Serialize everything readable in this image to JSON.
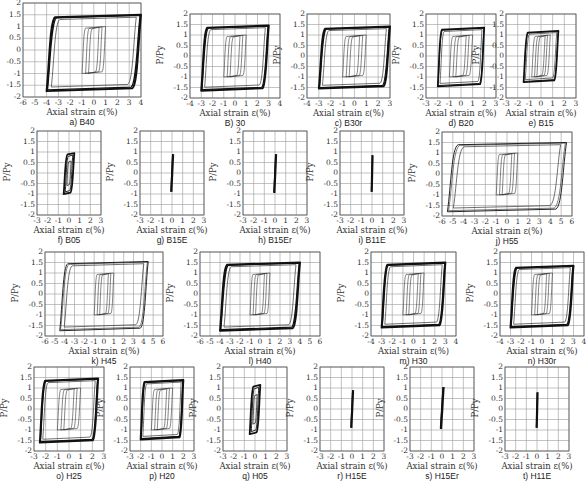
{
  "chart_data": {
    "type": "line",
    "title": "",
    "figure_description": "Grid of 20 axial load ratio vs axial strain hysteresis plots",
    "common": {
      "ylabel": "P/Py",
      "xlabel": "Axial strain ε(%)",
      "yticks": [
        -2,
        -1.5,
        -1,
        -0.5,
        0,
        0.5,
        1,
        1.5,
        2
      ],
      "ytick_labels": [
        "-2",
        "-1.5",
        "-1",
        "-0.5",
        "0",
        "0.5",
        "1",
        "1.5",
        "2"
      ],
      "ylim": [
        -2,
        2
      ],
      "grid": true
    },
    "panels": [
      {
        "id": "a",
        "caption": "a) B40",
        "xlim": [
          -6,
          4
        ],
        "xticks": [
          -6,
          -5,
          -4,
          -3,
          -2,
          -1,
          0,
          1,
          2,
          3,
          4
        ],
        "xtick_labels": [
          "-6",
          "-5",
          "-4",
          "-3",
          "-2",
          "-1",
          "0",
          "1",
          "2",
          "3",
          "4"
        ],
        "box": [
          23,
          3,
          118,
          94
        ],
        "outer_strain": 4,
        "inner_strain": 1,
        "outer_tension": 1.5,
        "outer_compression": -1.75,
        "style": "large"
      },
      {
        "id": "b",
        "caption": "B) 30",
        "xlim": [
          -4,
          4
        ],
        "xticks": [
          -4,
          -3,
          -2,
          -1,
          0,
          1,
          2,
          3,
          4
        ],
        "xtick_labels": [
          "-4",
          "-3",
          "-2",
          "-1",
          "0",
          "1",
          "2",
          "3",
          "4"
        ],
        "box": [
          190,
          14,
          90,
          84
        ],
        "outer_strain": 3,
        "inner_strain": 1,
        "outer_tension": 1.45,
        "outer_compression": -1.65,
        "style": "large"
      },
      {
        "id": "c",
        "caption": "c) B30r",
        "xlim": [
          -4,
          3
        ],
        "xticks": [
          -4,
          -3,
          -2,
          -1,
          0,
          1,
          2,
          3
        ],
        "xtick_labels": [
          "-4",
          "-3",
          "-2",
          "-1",
          "0",
          "1",
          "2",
          "3"
        ],
        "box": [
          307,
          14,
          83,
          84
        ],
        "outer_strain": 3,
        "inner_strain": 1,
        "outer_tension": 1.4,
        "outer_compression": -1.55,
        "style": "large"
      },
      {
        "id": "d",
        "caption": "d) B20",
        "xlim": [
          -3,
          3
        ],
        "xticks": [
          -3,
          -2,
          -1,
          0,
          1,
          2,
          3
        ],
        "xtick_labels": [
          "-3",
          "-2",
          "-1",
          "0",
          "1",
          "2",
          "3"
        ],
        "box": [
          426,
          14,
          70,
          84
        ],
        "outer_strain": 2,
        "inner_strain": 1,
        "outer_tension": 1.35,
        "outer_compression": -1.45,
        "style": "medium"
      },
      {
        "id": "e",
        "caption": "e) B15",
        "xlim": [
          -3,
          3
        ],
        "xticks": [
          -3,
          -2,
          -1,
          0,
          1,
          2,
          3
        ],
        "xtick_labels": [
          "-3",
          "-2",
          "-1",
          "0",
          "1",
          "2",
          "3"
        ],
        "box": [
          506,
          14,
          70,
          84
        ],
        "outer_strain": 1.5,
        "inner_strain": 0.8,
        "outer_tension": 1.2,
        "outer_compression": -1.25,
        "style": "medium"
      },
      {
        "id": "f",
        "caption": "f) B05",
        "xlim": [
          -3,
          3
        ],
        "xticks": [
          -3,
          -2,
          -1,
          0,
          1,
          2,
          3
        ],
        "xtick_labels": [
          "-3",
          "-2",
          "-1",
          "0",
          "1",
          "2",
          "3"
        ],
        "box": [
          37,
          131,
          64,
          84
        ],
        "outer_strain": 0.5,
        "inner_strain": 0.3,
        "outer_tension": 0.95,
        "outer_compression": -1.0,
        "style": "small"
      },
      {
        "id": "g",
        "caption": "g) B15E",
        "xlim": [
          -3,
          3
        ],
        "xticks": [
          -3,
          -2,
          -1,
          0,
          1,
          2,
          3
        ],
        "xtick_labels": [
          "-3",
          "-2",
          "-1",
          "0",
          "1",
          "2",
          "3"
        ],
        "box": [
          140,
          131,
          64,
          84
        ],
        "outer_strain": 0.1,
        "inner_strain": 0,
        "outer_tension": 0.9,
        "outer_compression": -0.9,
        "style": "elastic"
      },
      {
        "id": "h",
        "caption": "h) B15Er",
        "xlim": [
          -3,
          3
        ],
        "xticks": [
          -3,
          -2,
          -1,
          0,
          1,
          2,
          3
        ],
        "xtick_labels": [
          "-3",
          "-2",
          "-1",
          "0",
          "1",
          "2",
          "3"
        ],
        "box": [
          243,
          131,
          64,
          84
        ],
        "outer_strain": 0.1,
        "inner_strain": 0,
        "outer_tension": 0.9,
        "outer_compression": -0.95,
        "style": "elastic"
      },
      {
        "id": "i",
        "caption": "i) B11E",
        "xlim": [
          -3,
          3
        ],
        "xticks": [
          -3,
          -2,
          -1,
          0,
          1,
          2,
          3
        ],
        "xtick_labels": [
          "-3",
          "-2",
          "-1",
          "0",
          "1",
          "2",
          "3"
        ],
        "box": [
          340,
          131,
          64,
          84
        ],
        "outer_strain": 0.05,
        "inner_strain": 0,
        "outer_tension": 0.85,
        "outer_compression": -0.9,
        "style": "elastic"
      },
      {
        "id": "j",
        "caption": "j) H55",
        "xlim": [
          -6,
          6
        ],
        "xticks": [
          -6,
          -5,
          -4,
          -3,
          -2,
          -1,
          0,
          1,
          2,
          3,
          4,
          5,
          6
        ],
        "xtick_labels": [
          "-6",
          "-5",
          "-4",
          "-3",
          "-2",
          "-1",
          "0",
          "1",
          "2",
          "3",
          "4",
          "5",
          "6"
        ],
        "box": [
          442,
          132,
          130,
          84
        ],
        "outer_strain": 5.5,
        "inner_strain": 1,
        "outer_tension": 1.5,
        "outer_compression": -1.8,
        "style": "thin"
      },
      {
        "id": "k",
        "caption": "k) H45",
        "xlim": [
          -6,
          6
        ],
        "xticks": [
          -6,
          -5,
          -4,
          -3,
          -2,
          -1,
          0,
          1,
          2,
          3,
          4,
          5,
          6
        ],
        "xtick_labels": [
          "-6",
          "-5",
          "-4",
          "-3",
          "-2",
          "-1",
          "0",
          "1",
          "2",
          "3",
          "4",
          "5",
          "6"
        ],
        "box": [
          45,
          252,
          118,
          84
        ],
        "outer_strain": 4.5,
        "inner_strain": 1,
        "outer_tension": 1.55,
        "outer_compression": -1.75,
        "style": "thin"
      },
      {
        "id": "l",
        "caption": "l) H40",
        "xlim": [
          -6,
          6
        ],
        "xticks": [
          -6,
          -5,
          -4,
          -3,
          -2,
          -1,
          0,
          1,
          2,
          3,
          4,
          5,
          6
        ],
        "xtick_labels": [
          "-6",
          "-5",
          "-4",
          "-3",
          "-2",
          "-1",
          "0",
          "1",
          "2",
          "3",
          "4",
          "5",
          "6"
        ],
        "box": [
          200,
          252,
          120,
          84
        ],
        "outer_strain": 4,
        "inner_strain": 1,
        "outer_tension": 1.5,
        "outer_compression": -1.75,
        "style": "large"
      },
      {
        "id": "m",
        "caption": "m) H30",
        "xlim": [
          -4,
          4
        ],
        "xticks": [
          -4,
          -3,
          -2,
          -1,
          0,
          1,
          2,
          3,
          4
        ],
        "xtick_labels": [
          "-4",
          "-3",
          "-2",
          "-1",
          "0",
          "1",
          "2",
          "3",
          "4"
        ],
        "box": [
          371,
          252,
          85,
          84
        ],
        "outer_strain": 3,
        "inner_strain": 1,
        "outer_tension": 1.5,
        "outer_compression": -1.6,
        "style": "large"
      },
      {
        "id": "n",
        "caption": "n) H30r",
        "xlim": [
          -4,
          4
        ],
        "xticks": [
          -4,
          -3,
          -2,
          -1,
          0,
          1,
          2,
          3,
          4
        ],
        "xtick_labels": [
          "-4",
          "-3",
          "-2",
          "-1",
          "0",
          "1",
          "2",
          "3",
          "4"
        ],
        "box": [
          500,
          252,
          84,
          84
        ],
        "outer_strain": 3,
        "inner_strain": 1,
        "outer_tension": 1.35,
        "outer_compression": -1.6,
        "style": "large"
      },
      {
        "id": "o",
        "caption": "o) H25",
        "xlim": [
          -3,
          3
        ],
        "xticks": [
          -3,
          -2,
          -1,
          0,
          1,
          2,
          3
        ],
        "xtick_labels": [
          "-3",
          "-2",
          "-1",
          "0",
          "1",
          "2",
          "3"
        ],
        "box": [
          34,
          367,
          70,
          84
        ],
        "outer_strain": 2.5,
        "inner_strain": 1,
        "outer_tension": 1.45,
        "outer_compression": -1.6,
        "style": "large"
      },
      {
        "id": "p",
        "caption": "p) H20",
        "xlim": [
          -3,
          3
        ],
        "xticks": [
          -3,
          -2,
          -1,
          0,
          1,
          2,
          3
        ],
        "xtick_labels": [
          "-3",
          "-2",
          "-1",
          "0",
          "1",
          "2",
          "3"
        ],
        "box": [
          130,
          367,
          64,
          84
        ],
        "outer_strain": 2,
        "inner_strain": 1,
        "outer_tension": 1.38,
        "outer_compression": -1.45,
        "style": "large"
      },
      {
        "id": "q",
        "caption": "q) H05",
        "xlim": [
          -3,
          3
        ],
        "xticks": [
          -3,
          -2,
          -1,
          0,
          1,
          2,
          3
        ],
        "xtick_labels": [
          "-3",
          "-2",
          "-1",
          "0",
          "1",
          "2",
          "3"
        ],
        "box": [
          223,
          367,
          64,
          84
        ],
        "outer_strain": 0.5,
        "inner_strain": 0.3,
        "outer_tension": 1.15,
        "outer_compression": -1.2,
        "style": "small"
      },
      {
        "id": "r",
        "caption": "r) H15E",
        "xlim": [
          -3,
          3
        ],
        "xticks": [
          -3,
          -2,
          -1,
          0,
          1,
          2,
          3
        ],
        "xtick_labels": [
          "-3",
          "-2",
          "-1",
          "0",
          "1",
          "2",
          "3"
        ],
        "box": [
          320,
          367,
          64,
          84
        ],
        "outer_strain": 0.1,
        "inner_strain": 0,
        "outer_tension": 0.9,
        "outer_compression": -0.9,
        "style": "elastic"
      },
      {
        "id": "s",
        "caption": "s) H15Er",
        "xlim": [
          -3,
          3
        ],
        "xticks": [
          -3,
          -2,
          -1,
          0,
          1,
          2,
          3
        ],
        "xtick_labels": [
          "-3",
          "-2",
          "-1",
          "0",
          "1",
          "2",
          "3"
        ],
        "box": [
          410,
          367,
          64,
          84
        ],
        "outer_strain": 0.15,
        "inner_strain": 0,
        "outer_tension": 1.05,
        "outer_compression": -0.95,
        "style": "elastic"
      },
      {
        "id": "t",
        "caption": "t) H11E",
        "xlim": [
          -3,
          3
        ],
        "xticks": [
          -3,
          -2,
          -1,
          0,
          1,
          2,
          3
        ],
        "xtick_labels": [
          "-3",
          "-2",
          "-1",
          "0",
          "1",
          "2",
          "3"
        ],
        "box": [
          505,
          367,
          64,
          84
        ],
        "outer_strain": 0.05,
        "inner_strain": 0,
        "outer_tension": 0.8,
        "outer_compression": -0.9,
        "style": "elastic"
      }
    ]
  }
}
